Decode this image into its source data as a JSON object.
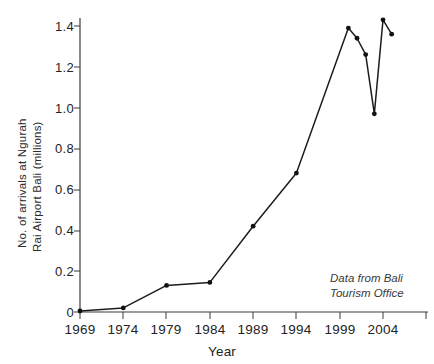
{
  "chart_data": {
    "type": "line",
    "title": "",
    "xlabel": "Year",
    "ylabel": "No. of arrivals at Ngurah Rai Airport Bali (millions)",
    "ylabel_lines": [
      "No. of arrivals at Ngurah",
      "Rai Airport Bali (millions)"
    ],
    "xlim": [
      1967,
      2007
    ],
    "ylim": [
      0,
      1.5
    ],
    "grid": false,
    "legend": "none",
    "annotation": "Data from Bali Tourism Office",
    "annotation_lines": [
      "Data from Bali",
      "Tourism Office"
    ],
    "xticks": [
      1969,
      1974,
      1979,
      1984,
      1989,
      1994,
      1999,
      2004
    ],
    "xtick_labels": [
      "1969",
      "1974",
      "1979",
      "1984",
      "1989",
      "1994",
      "1999",
      "2004"
    ],
    "yticks": [
      0,
      0.2,
      0.4,
      0.6,
      0.8,
      1.0,
      1.2,
      1.4
    ],
    "ytick_labels": [
      "0",
      "0.2",
      "0.4",
      "0.6",
      "0.8",
      "1.0",
      "1.2",
      "1.4"
    ],
    "x": [
      1969,
      1974,
      1979,
      1984,
      1989,
      1994,
      2000,
      2001,
      2002,
      2003,
      2004,
      2005
    ],
    "values": [
      0.005,
      0.02,
      0.13,
      0.145,
      0.42,
      0.68,
      1.39,
      1.34,
      1.26,
      0.97,
      1.43,
      1.36
    ],
    "series": [
      {
        "name": "Arrivals at Ngurah Rai Airport Bali",
        "x": [
          1969,
          1974,
          1979,
          1984,
          1989,
          1994,
          2000,
          2001,
          2002,
          2003,
          2004,
          2005
        ],
        "values": [
          0.005,
          0.02,
          0.13,
          0.145,
          0.42,
          0.68,
          1.39,
          1.34,
          1.26,
          0.97,
          1.43,
          1.36
        ],
        "color": "#111111",
        "marker": "dot"
      }
    ],
    "colors": {
      "line": "#111111",
      "marker": "#111111",
      "axis": "#3b3b3b",
      "text": "#232323",
      "background": "#ffffff"
    }
  }
}
